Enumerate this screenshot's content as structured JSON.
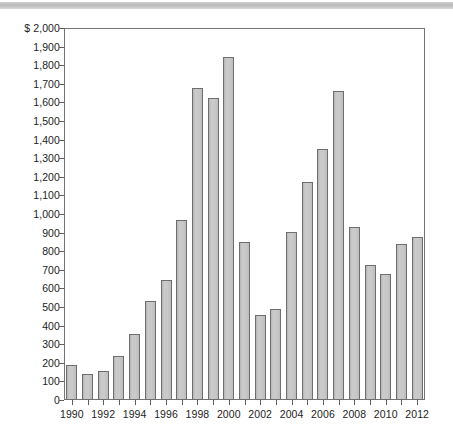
{
  "page": {
    "background_color": "#ffffff",
    "top_band_color": "#bfbfbf"
  },
  "chart_data": {
    "type": "bar",
    "title": "",
    "subtitle": "",
    "xlabel": "",
    "ylabel": "",
    "currency_prefix": "$",
    "ylim": [
      0,
      2000
    ],
    "ytick_step": 100,
    "grid": false,
    "legend": null,
    "bar_fill_color": "#c6c6c6",
    "bar_border_color": "#6e6e6e",
    "axis_color": "#737373",
    "categories": [
      "1990",
      "1991",
      "1992",
      "1993",
      "1994",
      "1995",
      "1996",
      "1997",
      "1998",
      "1999",
      "2000",
      "2001",
      "2002",
      "2003",
      "2004",
      "2005",
      "2006",
      "2007",
      "2008",
      "2009",
      "2010",
      "2011",
      "2012"
    ],
    "values": [
      188,
      140,
      158,
      235,
      355,
      530,
      645,
      970,
      1680,
      1625,
      1845,
      850,
      455,
      490,
      905,
      1170,
      1350,
      1660,
      930,
      725,
      680,
      840,
      875
    ],
    "ytick_labels": [
      "$ 2,000",
      "1,900",
      "1,800",
      "1,700",
      "1,600",
      "1,500",
      "1,400",
      "1,300",
      "1,200",
      "1,100",
      "1,000",
      "900",
      "800",
      "700",
      "600",
      "500",
      "400",
      "300",
      "200",
      "100",
      "0"
    ],
    "ytick_values": [
      2000,
      1900,
      1800,
      1700,
      1600,
      1500,
      1400,
      1300,
      1200,
      1100,
      1000,
      900,
      800,
      700,
      600,
      500,
      400,
      300,
      200,
      100,
      0
    ],
    "xtick_labels": [
      "1990",
      "1992",
      "1994",
      "1996",
      "1998",
      "2000",
      "2002",
      "2004",
      "2006",
      "2008",
      "2010",
      "2012"
    ],
    "xtick_label_step": 2
  }
}
